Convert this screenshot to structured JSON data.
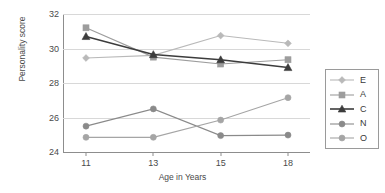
{
  "chart_data": {
    "type": "line",
    "title": "",
    "xlabel": "Age in Years",
    "ylabel": "Personality score",
    "categories": [
      "11",
      "13",
      "15",
      "18"
    ],
    "x_values": [
      11,
      13,
      15,
      18
    ],
    "ylim": [
      24,
      32
    ],
    "y_ticks": [
      "24",
      "26",
      "28",
      "30",
      "32"
    ],
    "y_tick_values": [
      24,
      26,
      28,
      30,
      32
    ],
    "grid": true,
    "legend_position": "right",
    "series": [
      {
        "name": "E",
        "label": "E",
        "color": "#b9b9b9",
        "marker": "diamond",
        "values": [
          29.45,
          29.6,
          30.75,
          30.3
        ]
      },
      {
        "name": "A",
        "label": "A",
        "color": "#9d9d9d",
        "marker": "square",
        "values": [
          31.2,
          29.5,
          29.1,
          29.35
        ]
      },
      {
        "name": "C",
        "label": "C",
        "color": "#3c3c3c",
        "marker": "triangle",
        "values": [
          30.7,
          29.65,
          29.35,
          28.9
        ]
      },
      {
        "name": "N",
        "label": "N",
        "color": "#8a8a8a",
        "marker": "circle",
        "values": [
          25.5,
          26.5,
          24.95,
          24.98
        ]
      },
      {
        "name": "O",
        "label": "O",
        "color": "#a5a5a5",
        "marker": "circle",
        "values": [
          24.85,
          24.85,
          25.85,
          27.15
        ]
      }
    ]
  }
}
